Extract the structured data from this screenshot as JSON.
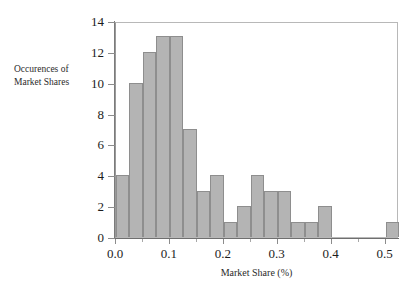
{
  "chart_data": {
    "type": "bar",
    "subtype": "histogram",
    "title": "",
    "xlabel": "Market Share (%)",
    "ylabel": "Occurences of Market Shares",
    "ylabel_lines": [
      "Occurences of",
      "Market Shares"
    ],
    "xlim": [
      0.0,
      0.525
    ],
    "ylim": [
      0,
      14
    ],
    "grid": false,
    "legend": null,
    "bin_width": 0.025,
    "bar_color": "#b4b4b4",
    "bar_edge_color": "#8e8e8e",
    "axis_color": "#7b7b7b",
    "xticks": [
      0.0,
      0.1,
      0.2,
      0.3,
      0.4,
      0.5
    ],
    "xtick_labels": [
      "0.0",
      "0.1",
      "0.2",
      "0.3",
      "0.4",
      "0.5"
    ],
    "xticks_minor": [
      0.05,
      0.15,
      0.25,
      0.35,
      0.45
    ],
    "yticks": [
      0,
      2,
      4,
      6,
      8,
      10,
      12,
      14
    ],
    "ytick_labels": [
      "0",
      "2",
      "4",
      "6",
      "8",
      "10",
      "12",
      "14"
    ],
    "bins": [
      {
        "x0": 0.0,
        "x1": 0.025,
        "count": 4
      },
      {
        "x0": 0.025,
        "x1": 0.05,
        "count": 10
      },
      {
        "x0": 0.05,
        "x1": 0.075,
        "count": 12
      },
      {
        "x0": 0.075,
        "x1": 0.1,
        "count": 13
      },
      {
        "x0": 0.1,
        "x1": 0.125,
        "count": 13
      },
      {
        "x0": 0.125,
        "x1": 0.15,
        "count": 7
      },
      {
        "x0": 0.15,
        "x1": 0.175,
        "count": 3
      },
      {
        "x0": 0.175,
        "x1": 0.2,
        "count": 4
      },
      {
        "x0": 0.2,
        "x1": 0.225,
        "count": 1
      },
      {
        "x0": 0.225,
        "x1": 0.25,
        "count": 2
      },
      {
        "x0": 0.25,
        "x1": 0.275,
        "count": 4
      },
      {
        "x0": 0.275,
        "x1": 0.3,
        "count": 3
      },
      {
        "x0": 0.3,
        "x1": 0.325,
        "count": 3
      },
      {
        "x0": 0.325,
        "x1": 0.35,
        "count": 1
      },
      {
        "x0": 0.35,
        "x1": 0.375,
        "count": 1
      },
      {
        "x0": 0.375,
        "x1": 0.4,
        "count": 2
      },
      {
        "x0": 0.4,
        "x1": 0.425,
        "count": 0
      },
      {
        "x0": 0.425,
        "x1": 0.45,
        "count": 0
      },
      {
        "x0": 0.45,
        "x1": 0.475,
        "count": 0
      },
      {
        "x0": 0.475,
        "x1": 0.5,
        "count": 0
      },
      {
        "x0": 0.5,
        "x1": 0.525,
        "count": 1
      }
    ],
    "categories": [
      "0.000",
      "0.025",
      "0.050",
      "0.075",
      "0.100",
      "0.125",
      "0.150",
      "0.175",
      "0.200",
      "0.225",
      "0.250",
      "0.275",
      "0.300",
      "0.325",
      "0.350",
      "0.375",
      "0.400",
      "0.425",
      "0.450",
      "0.475",
      "0.500"
    ],
    "values": [
      4,
      10,
      12,
      13,
      13,
      7,
      3,
      4,
      1,
      2,
      4,
      3,
      3,
      1,
      1,
      2,
      0,
      0,
      0,
      0,
      1
    ]
  }
}
